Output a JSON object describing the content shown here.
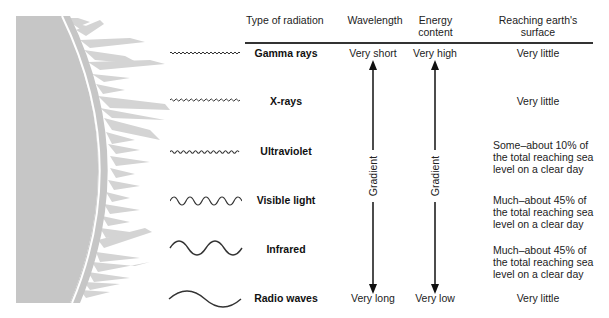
{
  "diagram": {
    "headers": {
      "type": "Type of radiation",
      "wavelength": "Wavelength",
      "energy": "Energy content",
      "energy_line1": "Energy",
      "energy_line2": "content",
      "reaching_line1": "Reaching earth's",
      "reaching_line2": "surface"
    },
    "rows": [
      {
        "type": "Gamma rays",
        "wave_icon": "very-short-wave-icon",
        "reaching": [
          "Very little"
        ]
      },
      {
        "type": "X-rays",
        "wave_icon": "short-wave-icon",
        "reaching": [
          "Very little"
        ]
      },
      {
        "type": "Ultraviolet",
        "wave_icon": "ultraviolet-wave-icon",
        "reaching": [
          "Some–about 10% of",
          "the total reaching sea",
          "level on a clear day"
        ]
      },
      {
        "type": "Visible light",
        "wave_icon": "visible-wave-icon",
        "reaching": [
          "Much–about 45% of",
          "the total reaching sea",
          "level on a clear day"
        ]
      },
      {
        "type": "Infrared",
        "wave_icon": "infrared-wave-icon",
        "reaching": [
          "Much–about 45% of",
          "the total reaching sea",
          "level on a clear day"
        ]
      },
      {
        "type": "Radio waves",
        "wave_icon": "radio-wave-icon",
        "reaching": [
          "Very little"
        ]
      }
    ],
    "wavelength": {
      "top": "Very short",
      "bottom": "Very long",
      "label": "Gradient"
    },
    "energy": {
      "top": "Very high",
      "bottom": "Very low",
      "label": "Gradient"
    },
    "colors": {
      "sun": "#c6c6c6",
      "corona": "#d6d6d6",
      "ink": "#222222"
    }
  }
}
